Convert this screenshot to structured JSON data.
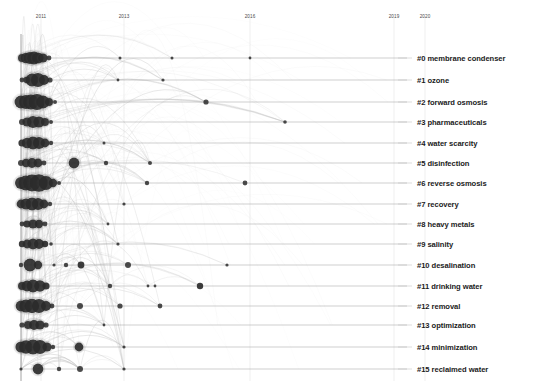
{
  "chart_data": {
    "type": "scatter",
    "title": "",
    "subtitle": "",
    "xlabel": "",
    "ylabel": "",
    "grid": false,
    "legend_position": "right",
    "xlim": [
      2010.2,
      2021.0
    ],
    "x_ticks": [
      "2011",
      "2013",
      "2016",
      "2019",
      "2020"
    ],
    "x_tick_values": [
      2011,
      2013,
      2016,
      2019,
      2020
    ],
    "x_tick_px": [
      41,
      124,
      250,
      394,
      425
    ],
    "axis": {
      "vertical_axis_x_px": 21,
      "plot_left_px": 21,
      "plot_right_px": 410,
      "timeline_color": "#999999",
      "node_color": "#2b2b2b",
      "link_color": "#b9b9b9"
    },
    "categories": [
      "#0 membrane condenser",
      "#1 ozone",
      "#2 forward osmosis",
      "#3 pharmaceuticals",
      "#4 water scarcity",
      "#5 disinfection",
      "#6 reverse osmosis",
      "#7 recovery",
      "#8 heavy metals",
      "#9 salinity",
      "#10 desalination",
      "#11 drinking water",
      "#12 removal",
      "#13 optimization",
      "#14 minimization",
      "#15 reclaimed water"
    ],
    "series": [
      {
        "name": "#0 membrane condenser",
        "row": 0,
        "y_px": 58,
        "line_end_px": 407,
        "nodes": [
          {
            "x": 22,
            "r": 4.0
          },
          {
            "x": 26,
            "r": 5.2
          },
          {
            "x": 30,
            "r": 6.0
          },
          {
            "x": 34,
            "r": 6.4
          },
          {
            "x": 38,
            "r": 5.6
          },
          {
            "x": 43,
            "r": 4.6
          },
          {
            "x": 49,
            "r": 2.4
          },
          {
            "x": 120,
            "r": 1.5
          },
          {
            "x": 172,
            "r": 1.5
          },
          {
            "x": 250,
            "r": 1.4
          }
        ]
      },
      {
        "name": "#1 ozone",
        "row": 1,
        "y_px": 80,
        "line_end_px": 407,
        "nodes": [
          {
            "x": 22,
            "r": 2.4
          },
          {
            "x": 27,
            "r": 3.4
          },
          {
            "x": 32,
            "r": 6.4
          },
          {
            "x": 38,
            "r": 7.0
          },
          {
            "x": 44,
            "r": 5.0
          },
          {
            "x": 50,
            "r": 2.6
          },
          {
            "x": 118,
            "r": 1.4
          },
          {
            "x": 163,
            "r": 1.6
          }
        ]
      },
      {
        "name": "#2 forward osmosis",
        "row": 2,
        "y_px": 102,
        "line_end_px": 407,
        "nodes": [
          {
            "x": 21,
            "r": 6.5
          },
          {
            "x": 26,
            "r": 7.0
          },
          {
            "x": 31,
            "r": 7.5
          },
          {
            "x": 37,
            "r": 8.0
          },
          {
            "x": 43,
            "r": 6.5
          },
          {
            "x": 49,
            "r": 4.0
          },
          {
            "x": 55,
            "r": 2.0
          },
          {
            "x": 206,
            "r": 2.6
          }
        ]
      },
      {
        "name": "#3 pharmaceuticals",
        "row": 3,
        "y_px": 122,
        "line_end_px": 407,
        "nodes": [
          {
            "x": 22,
            "r": 3.0
          },
          {
            "x": 27,
            "r": 4.6
          },
          {
            "x": 33,
            "r": 6.0
          },
          {
            "x": 39,
            "r": 5.6
          },
          {
            "x": 45,
            "r": 4.0
          },
          {
            "x": 51,
            "r": 2.0
          },
          {
            "x": 285,
            "r": 1.8
          }
        ]
      },
      {
        "name": "#4 water scarcity",
        "row": 4,
        "y_px": 143,
        "line_end_px": 407,
        "nodes": [
          {
            "x": 22,
            "r": 3.6
          },
          {
            "x": 27,
            "r": 5.2
          },
          {
            "x": 33,
            "r": 6.4
          },
          {
            "x": 39,
            "r": 6.0
          },
          {
            "x": 45,
            "r": 4.4
          },
          {
            "x": 51,
            "r": 2.2
          },
          {
            "x": 104,
            "r": 1.5
          }
        ]
      },
      {
        "name": "#5 disinfection",
        "row": 5,
        "y_px": 163,
        "line_end_px": 407,
        "nodes": [
          {
            "x": 21,
            "r": 3.0
          },
          {
            "x": 26,
            "r": 4.2
          },
          {
            "x": 32,
            "r": 5.0
          },
          {
            "x": 38,
            "r": 4.4
          },
          {
            "x": 44,
            "r": 2.4
          },
          {
            "x": 74,
            "r": 5.4
          },
          {
            "x": 106,
            "r": 2.2
          },
          {
            "x": 150,
            "r": 2.0
          }
        ]
      },
      {
        "name": "#6 reverse osmosis",
        "row": 6,
        "y_px": 183,
        "line_end_px": 407,
        "nodes": [
          {
            "x": 21,
            "r": 6.0
          },
          {
            "x": 26,
            "r": 7.4
          },
          {
            "x": 32,
            "r": 8.4
          },
          {
            "x": 39,
            "r": 8.8
          },
          {
            "x": 46,
            "r": 7.0
          },
          {
            "x": 53,
            "r": 4.2
          },
          {
            "x": 59,
            "r": 2.0
          },
          {
            "x": 147,
            "r": 2.2
          },
          {
            "x": 245,
            "r": 2.4
          }
        ]
      },
      {
        "name": "#7 recovery",
        "row": 7,
        "y_px": 204,
        "line_end_px": 407,
        "nodes": [
          {
            "x": 21,
            "r": 4.4
          },
          {
            "x": 26,
            "r": 5.6
          },
          {
            "x": 32,
            "r": 6.4
          },
          {
            "x": 38,
            "r": 6.0
          },
          {
            "x": 44,
            "r": 4.4
          },
          {
            "x": 50,
            "r": 2.2
          },
          {
            "x": 124,
            "r": 1.6
          }
        ]
      },
      {
        "name": "#8 heavy metals",
        "row": 8,
        "y_px": 224,
        "line_end_px": 407,
        "nodes": [
          {
            "x": 22,
            "r": 2.4
          },
          {
            "x": 27,
            "r": 3.6
          },
          {
            "x": 33,
            "r": 4.6
          },
          {
            "x": 39,
            "r": 4.2
          },
          {
            "x": 45,
            "r": 2.4
          },
          {
            "x": 108,
            "r": 1.4
          }
        ]
      },
      {
        "name": "#9 salinity",
        "row": 9,
        "y_px": 244,
        "line_end_px": 407,
        "nodes": [
          {
            "x": 22,
            "r": 3.2
          },
          {
            "x": 27,
            "r": 4.4
          },
          {
            "x": 33,
            "r": 5.4
          },
          {
            "x": 39,
            "r": 5.0
          },
          {
            "x": 45,
            "r": 3.2
          },
          {
            "x": 51,
            "r": 1.8
          },
          {
            "x": 118,
            "r": 1.6
          }
        ]
      },
      {
        "name": "#10 desalination",
        "row": 10,
        "y_px": 265,
        "line_end_px": 407,
        "nodes": [
          {
            "x": 21,
            "r": 2.2
          },
          {
            "x": 30,
            "r": 6.4
          },
          {
            "x": 38,
            "r": 4.2
          },
          {
            "x": 54,
            "r": 1.6
          },
          {
            "x": 66,
            "r": 2.2
          },
          {
            "x": 81,
            "r": 3.4
          },
          {
            "x": 128,
            "r": 3.0
          },
          {
            "x": 227,
            "r": 1.6
          }
        ]
      },
      {
        "name": "#11 drinking water",
        "row": 11,
        "y_px": 286,
        "line_end_px": 407,
        "nodes": [
          {
            "x": 22,
            "r": 4.0
          },
          {
            "x": 27,
            "r": 5.4
          },
          {
            "x": 33,
            "r": 6.4
          },
          {
            "x": 40,
            "r": 5.8
          },
          {
            "x": 46,
            "r": 3.6
          },
          {
            "x": 110,
            "r": 2.2
          },
          {
            "x": 148,
            "r": 1.4
          },
          {
            "x": 155,
            "r": 1.4
          },
          {
            "x": 200,
            "r": 3.2
          }
        ]
      },
      {
        "name": "#12 removal",
        "row": 12,
        "y_px": 306,
        "line_end_px": 407,
        "nodes": [
          {
            "x": 21,
            "r": 5.4
          },
          {
            "x": 26,
            "r": 6.6
          },
          {
            "x": 32,
            "r": 7.2
          },
          {
            "x": 39,
            "r": 7.0
          },
          {
            "x": 46,
            "r": 5.0
          },
          {
            "x": 52,
            "r": 2.4
          },
          {
            "x": 80,
            "r": 3.0
          },
          {
            "x": 120,
            "r": 2.6
          },
          {
            "x": 160,
            "r": 2.4
          }
        ]
      },
      {
        "name": "#13 optimization",
        "row": 13,
        "y_px": 325,
        "line_end_px": 407,
        "nodes": [
          {
            "x": 22,
            "r": 2.6
          },
          {
            "x": 28,
            "r": 4.0
          },
          {
            "x": 34,
            "r": 5.0
          },
          {
            "x": 40,
            "r": 4.6
          },
          {
            "x": 46,
            "r": 2.6
          },
          {
            "x": 104,
            "r": 1.4
          }
        ]
      },
      {
        "name": "#14 minimization",
        "row": 14,
        "y_px": 347,
        "line_end_px": 407,
        "nodes": [
          {
            "x": 21,
            "r": 5.6
          },
          {
            "x": 26,
            "r": 6.8
          },
          {
            "x": 33,
            "r": 7.4
          },
          {
            "x": 40,
            "r": 7.0
          },
          {
            "x": 47,
            "r": 4.6
          },
          {
            "x": 53,
            "r": 2.2
          },
          {
            "x": 79,
            "r": 4.4
          },
          {
            "x": 124,
            "r": 1.6
          }
        ]
      },
      {
        "name": "#15 reclaimed water",
        "row": 15,
        "y_px": 369,
        "line_end_px": 407,
        "nodes": [
          {
            "x": 21,
            "r": 1.6
          },
          {
            "x": 38,
            "r": 5.4
          },
          {
            "x": 59,
            "r": 2.2
          },
          {
            "x": 80,
            "r": 3.0
          },
          {
            "x": 124,
            "r": 1.6
          }
        ]
      }
    ]
  }
}
